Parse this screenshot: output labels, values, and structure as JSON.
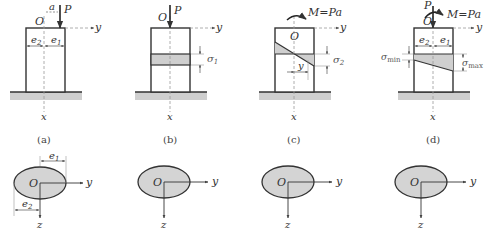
{
  "figure": {
    "panels": [
      {
        "id": "a",
        "caption": "(a)",
        "origin_label": "O",
        "force_label": "P",
        "offset_label": "a",
        "axis_y": "y",
        "axis_x": "x",
        "dim_left": "e2",
        "dim_right": "e1"
      },
      {
        "id": "b",
        "caption": "(b)",
        "origin_label": "O",
        "force_label": "P",
        "axis_y": "y",
        "axis_x": "x",
        "stress_label": "σ1"
      },
      {
        "id": "c",
        "caption": "(c)",
        "origin_label": "O",
        "moment_label": "M=Pa",
        "axis_y": "y",
        "axis_x": "x",
        "coord_label": "y",
        "stress_label": "σ2"
      },
      {
        "id": "d",
        "caption": "(d)",
        "origin_label": "O",
        "force_label": "P",
        "moment_label": "M=Pa",
        "axis_y": "y",
        "axis_x": "x",
        "dim_left": "e2",
        "dim_right": "e1",
        "stress_min_label": "σmin",
        "stress_max_label": "σmax"
      }
    ],
    "cross_sections": [
      {
        "origin_label": "O",
        "axis_y": "y",
        "axis_z": "z",
        "dim_top": "e1",
        "dim_bottom": "e2"
      },
      {
        "origin_label": "O",
        "axis_y": "y",
        "axis_z": "z"
      },
      {
        "origin_label": "O",
        "axis_y": "y",
        "axis_z": "z"
      },
      {
        "origin_label": "O",
        "axis_y": "y",
        "axis_z": "z"
      }
    ],
    "colors": {
      "outline": "#3a3a3a",
      "fill": "#d4d4d4",
      "ground": "#cfcfcf",
      "dashed": "#9a9a9a"
    }
  }
}
